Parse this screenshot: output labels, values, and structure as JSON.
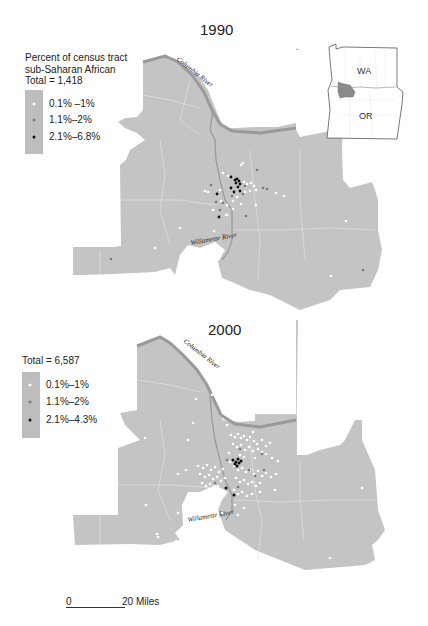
{
  "maps": [
    {
      "year": "1990",
      "legend": {
        "title_lines": [
          "Percent of census tract",
          "sub-Saharan African"
        ],
        "total": "Total = 1,418",
        "items": [
          {
            "label": "0.1% –1%",
            "color": "#ffffff"
          },
          {
            "label": "1.1%–2%",
            "color": "#7a7a7a"
          },
          {
            "label": "2.1%–6.8%",
            "color": "#111111"
          }
        ]
      },
      "rivers": {
        "columbia": "Columbia River",
        "willamette": "Willamette River"
      }
    },
    {
      "year": "2000",
      "legend": {
        "total": "Total = 6,587",
        "items": [
          {
            "label": "0.1%–1%",
            "color": "#ffffff"
          },
          {
            "label": "1.1%–2%",
            "color": "#7a7a7a"
          },
          {
            "label": "2.1%–4.3%",
            "color": "#111111"
          }
        ]
      },
      "rivers": {
        "columbia": "Columbia River",
        "willamette": "Willamette River"
      }
    }
  ],
  "inset": {
    "states": [
      "WA",
      "OR"
    ]
  },
  "scale_bar": {
    "start": "0",
    "end": "20 Miles"
  },
  "colors": {
    "land": "#c4c4c4",
    "river": "#9a9a9a",
    "boundary": "#e2e2e2"
  }
}
